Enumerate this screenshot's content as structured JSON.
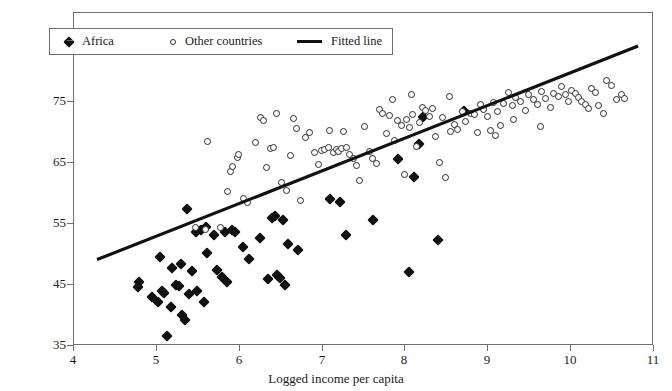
{
  "chart_data": {
    "type": "scatter",
    "title": "",
    "subtitle": "",
    "xlabel": "Logged income per capita",
    "ylabel": "",
    "xlim": [
      4,
      11
    ],
    "ylim": [
      35,
      88
    ],
    "xticks": [
      4,
      5,
      6,
      7,
      8,
      9,
      10,
      11
    ],
    "xticklabels": [
      "4",
      "5",
      "6",
      "7",
      "8",
      "9",
      "10",
      "11"
    ],
    "yticks": [
      35,
      45,
      55,
      65,
      75,
      85
    ],
    "yticklabels": [
      "35",
      "45",
      "55",
      "65",
      "75",
      "85"
    ],
    "grid": false,
    "legend_position": "upper-left",
    "legend": [
      {
        "label": "Africa",
        "marker": "filled-diamond",
        "color": "#111111"
      },
      {
        "label": "Other countries",
        "marker": "open-circle",
        "color": "#2b2b2b"
      },
      {
        "label": "Fitted line",
        "marker": "line",
        "color": "#111111"
      }
    ],
    "series": [
      {
        "name": "Africa",
        "marker": "filled-diamond",
        "color": "#111111",
        "points": [
          [
            4.78,
            44.5
          ],
          [
            4.8,
            45.3
          ],
          [
            4.95,
            42.8
          ],
          [
            5.02,
            42.0
          ],
          [
            5.05,
            49.5
          ],
          [
            5.08,
            43.8
          ],
          [
            5.1,
            43.5
          ],
          [
            5.14,
            36.5
          ],
          [
            5.18,
            41.3
          ],
          [
            5.2,
            47.6
          ],
          [
            5.24,
            44.9
          ],
          [
            5.28,
            44.6
          ],
          [
            5.3,
            48.2
          ],
          [
            5.32,
            40.0
          ],
          [
            5.35,
            39.1
          ],
          [
            5.38,
            57.3
          ],
          [
            5.4,
            43.4
          ],
          [
            5.44,
            47.2
          ],
          [
            5.48,
            53.6
          ],
          [
            5.5,
            43.9
          ],
          [
            5.55,
            53.8
          ],
          [
            5.58,
            42.0
          ],
          [
            5.6,
            54.4
          ],
          [
            5.62,
            50.1
          ],
          [
            5.7,
            53.0
          ],
          [
            5.74,
            47.3
          ],
          [
            5.8,
            46.2
          ],
          [
            5.84,
            53.5
          ],
          [
            5.86,
            45.4
          ],
          [
            5.92,
            53.9
          ],
          [
            5.96,
            53.6
          ],
          [
            6.05,
            51.0
          ],
          [
            6.12,
            49.1
          ],
          [
            6.26,
            52.6
          ],
          [
            6.35,
            45.8
          ],
          [
            6.4,
            55.8
          ],
          [
            6.44,
            56.2
          ],
          [
            6.46,
            46.5
          ],
          [
            6.5,
            46.0
          ],
          [
            6.54,
            55.5
          ],
          [
            6.56,
            44.8
          ],
          [
            6.6,
            51.6
          ],
          [
            6.72,
            50.5
          ],
          [
            7.1,
            59.0
          ],
          [
            7.22,
            58.5
          ],
          [
            7.3,
            53.0
          ],
          [
            7.62,
            55.5
          ],
          [
            7.92,
            65.5
          ],
          [
            8.06,
            47.0
          ],
          [
            8.12,
            62.5
          ],
          [
            8.18,
            68.0
          ],
          [
            8.22,
            72.3
          ],
          [
            8.4,
            52.2
          ],
          [
            8.72,
            73.4
          ]
        ]
      },
      {
        "name": "Other countries",
        "marker": "open-circle",
        "color": "#2b2b2b",
        "points": [
          [
            5.48,
            54.2
          ],
          [
            5.6,
            53.9
          ],
          [
            5.62,
            68.4
          ],
          [
            5.78,
            54.3
          ],
          [
            5.86,
            60.2
          ],
          [
            5.9,
            63.5
          ],
          [
            5.92,
            64.3
          ],
          [
            5.98,
            65.8
          ],
          [
            6.0,
            66.2
          ],
          [
            6.06,
            59.0
          ],
          [
            6.1,
            58.4
          ],
          [
            6.2,
            68.2
          ],
          [
            6.26,
            72.3
          ],
          [
            6.3,
            71.8
          ],
          [
            6.34,
            64.1
          ],
          [
            6.38,
            67.2
          ],
          [
            6.42,
            67.4
          ],
          [
            6.46,
            73.0
          ],
          [
            6.52,
            61.6
          ],
          [
            6.58,
            60.4
          ],
          [
            6.62,
            66.0
          ],
          [
            6.66,
            72.2
          ],
          [
            6.7,
            70.5
          ],
          [
            6.74,
            58.7
          ],
          [
            6.8,
            69.0
          ],
          [
            6.86,
            69.8
          ],
          [
            6.92,
            66.6
          ],
          [
            6.96,
            64.6
          ],
          [
            7.0,
            66.9
          ],
          [
            7.04,
            67.1
          ],
          [
            7.08,
            67.3
          ],
          [
            7.1,
            70.2
          ],
          [
            7.14,
            66.5
          ],
          [
            7.18,
            67.0
          ],
          [
            7.2,
            66.8
          ],
          [
            7.24,
            67.2
          ],
          [
            7.26,
            70.0
          ],
          [
            7.3,
            67.4
          ],
          [
            7.34,
            66.2
          ],
          [
            7.38,
            65.5
          ],
          [
            7.42,
            64.5
          ],
          [
            7.46,
            62.0
          ],
          [
            7.52,
            70.8
          ],
          [
            7.58,
            66.8
          ],
          [
            7.62,
            65.6
          ],
          [
            7.66,
            64.8
          ],
          [
            7.7,
            73.6
          ],
          [
            7.74,
            73.0
          ],
          [
            7.78,
            69.6
          ],
          [
            7.82,
            72.6
          ],
          [
            7.86,
            75.2
          ],
          [
            7.88,
            68.5
          ],
          [
            7.92,
            71.8
          ],
          [
            7.96,
            71.0
          ],
          [
            8.0,
            63.0
          ],
          [
            8.02,
            72.0
          ],
          [
            8.06,
            70.6
          ],
          [
            8.1,
            72.8
          ],
          [
            8.14,
            67.5
          ],
          [
            8.18,
            71.4
          ],
          [
            8.22,
            74.0
          ],
          [
            8.26,
            73.4
          ],
          [
            8.3,
            72.5
          ],
          [
            8.34,
            73.8
          ],
          [
            8.38,
            69.2
          ],
          [
            8.42,
            65.0
          ],
          [
            8.46,
            72.3
          ],
          [
            8.5,
            62.4
          ],
          [
            8.56,
            70.0
          ],
          [
            8.6,
            71.2
          ],
          [
            8.64,
            70.4
          ],
          [
            8.7,
            73.2
          ],
          [
            8.74,
            71.6
          ],
          [
            8.8,
            73.0
          ],
          [
            8.84,
            72.8
          ],
          [
            8.88,
            69.8
          ],
          [
            8.92,
            74.4
          ],
          [
            8.96,
            73.6
          ],
          [
            9.0,
            72.4
          ],
          [
            9.04,
            70.2
          ],
          [
            9.08,
            74.8
          ],
          [
            9.12,
            73.2
          ],
          [
            9.16,
            71.0
          ],
          [
            9.2,
            74.6
          ],
          [
            9.26,
            76.4
          ],
          [
            9.3,
            74.2
          ],
          [
            9.34,
            75.6
          ],
          [
            9.4,
            75.0
          ],
          [
            9.46,
            73.4
          ],
          [
            9.5,
            76.0
          ],
          [
            9.56,
            75.2
          ],
          [
            9.6,
            74.4
          ],
          [
            9.66,
            76.6
          ],
          [
            9.7,
            75.4
          ],
          [
            9.76,
            74.0
          ],
          [
            9.8,
            76.2
          ],
          [
            9.86,
            75.8
          ],
          [
            9.9,
            77.4
          ],
          [
            9.94,
            76.0
          ],
          [
            9.98,
            75.0
          ],
          [
            10.02,
            76.8
          ],
          [
            10.06,
            76.2
          ],
          [
            10.1,
            75.6
          ],
          [
            10.14,
            75.0
          ],
          [
            10.18,
            74.4
          ],
          [
            10.22,
            73.8
          ],
          [
            10.26,
            77.0
          ],
          [
            10.3,
            76.4
          ],
          [
            10.34,
            74.2
          ],
          [
            10.44,
            78.4
          ],
          [
            10.5,
            77.6
          ],
          [
            10.56,
            75.2
          ],
          [
            10.62,
            76.0
          ],
          [
            10.66,
            75.4
          ],
          [
            9.1,
            69.4
          ],
          [
            9.32,
            72.0
          ],
          [
            9.64,
            70.8
          ],
          [
            10.4,
            73.0
          ],
          [
            8.08,
            76.0
          ],
          [
            8.54,
            75.8
          ]
        ]
      }
    ],
    "fitted_line": {
      "name": "Fitted line",
      "color": "#111111",
      "x0": 4.29,
      "y0": 49.0,
      "x1": 10.82,
      "y1": 84.0
    }
  }
}
